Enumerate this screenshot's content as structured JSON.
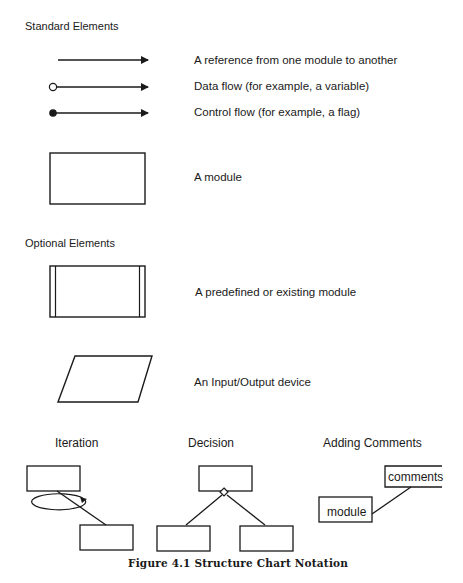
{
  "sections": {
    "standard": {
      "heading": "Standard Elements",
      "items": [
        {
          "symbol": "plain-arrow",
          "label": "A reference from one module to another"
        },
        {
          "symbol": "open-circle-arrow",
          "label": "Data flow (for example, a variable)"
        },
        {
          "symbol": "filled-circle-arrow",
          "label": "Control flow (for example, a flag)"
        },
        {
          "symbol": "rectangle",
          "label": "A module"
        }
      ]
    },
    "optional": {
      "heading": "Optional Elements",
      "items": [
        {
          "symbol": "double-sided-rectangle",
          "label": "A predefined or existing module"
        },
        {
          "symbol": "parallelogram",
          "label": "An Input/Output device"
        }
      ]
    }
  },
  "examples": {
    "iteration": {
      "title": "Iteration"
    },
    "decision": {
      "title": "Decision"
    },
    "comments": {
      "title": "Adding Comments",
      "comment_label": "comments",
      "module_label": "module"
    }
  },
  "caption": "Figure 4.1  Structure Chart Notation",
  "colors": {
    "ink": "#1a1a1a",
    "background": "#ffffff"
  }
}
